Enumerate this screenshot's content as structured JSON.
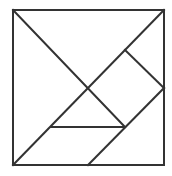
{
  "diagram": {
    "type": "tangram",
    "stroke_color": "#333333",
    "background_color": "#ffffff",
    "outer_square": {
      "x1": 13,
      "y1": 10,
      "x2": 164,
      "y2": 165
    },
    "lines": [
      {
        "name": "diagonal-tl-to-square-corner",
        "x1": 13,
        "y1": 10,
        "x2": 125,
        "y2": 127
      },
      {
        "name": "diagonal-bl-to-tr",
        "x1": 13,
        "y1": 165,
        "x2": 164,
        "y2": 10
      },
      {
        "name": "small-square-upper-edge",
        "x1": 125,
        "y1": 50,
        "x2": 164,
        "y2": 88
      },
      {
        "name": "parallelogram-right-edge",
        "x1": 164,
        "y1": 88,
        "x2": 88,
        "y2": 165
      },
      {
        "name": "small-triangle-base",
        "x1": 51,
        "y1": 127,
        "x2": 125,
        "y2": 127
      }
    ],
    "pieces": [
      "large-triangle-top",
      "large-triangle-left",
      "medium-triangle-right",
      "small-square",
      "small-triangle-center",
      "small-triangle-corner",
      "parallelogram-bottom"
    ]
  }
}
